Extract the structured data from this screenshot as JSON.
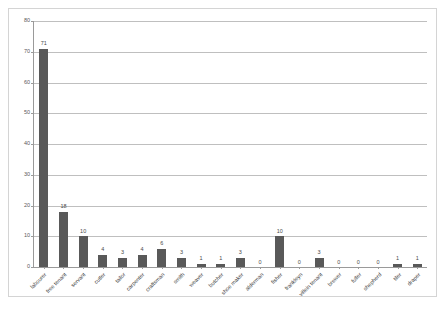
{
  "chart_data": {
    "type": "bar",
    "title": "",
    "subtitle": "",
    "xlabel": "",
    "ylabel": "",
    "ylim": [
      0,
      80
    ],
    "yticks": [
      0,
      10,
      20,
      30,
      40,
      50,
      60,
      70,
      80
    ],
    "grid": true,
    "legend": false,
    "bar_color": "#595959",
    "gridline_color": "#bfbfbf",
    "axis_color": "#9a9a9a",
    "categories": [
      "labourer",
      "free tenant",
      "servant",
      "cutler",
      "tailor",
      "carpenter",
      "craftsman",
      "smith",
      "weaver",
      "butcher",
      "shoe maker",
      "alderman",
      "fisher",
      "frankleyn",
      "villein tenant",
      "brewer",
      "fuller",
      "shepherd",
      "tiler",
      "draper"
    ],
    "values": [
      71,
      18,
      10,
      4,
      3,
      4,
      6,
      3,
      1,
      1,
      3,
      0,
      10,
      0,
      3,
      0,
      0,
      0,
      1,
      1
    ]
  }
}
